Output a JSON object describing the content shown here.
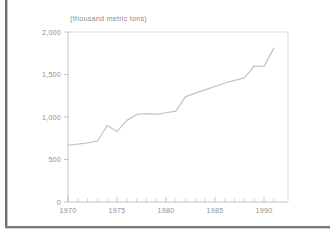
{
  "page": {
    "background_color": "#ffffff",
    "border_color": "#6e6e6e"
  },
  "chart_data": {
    "type": "line",
    "title": "(thousand metric tons)",
    "subtitle": "",
    "xlabel": "",
    "ylabel": "",
    "xlim": [
      1969,
      1991.5
    ],
    "ylim": [
      0,
      2000
    ],
    "grid": false,
    "legend_position": "none",
    "line_color": "#c4c4c4",
    "axis_color": "#b6b6b6",
    "tick_label_color": "#8f8f8f",
    "y_ticks": [
      0,
      500,
      1000,
      1500,
      2000
    ],
    "y_tick_labels": [
      "0",
      "500",
      "1,000",
      "1,500",
      "2,000"
    ],
    "x_ticks": [
      1970,
      1975,
      1980,
      1985,
      1990
    ],
    "x_tick_labels": [
      "1970",
      "1975",
      "1980",
      "1985",
      "1990"
    ],
    "x_minor_ticks": [
      1971,
      1972,
      1973,
      1974,
      1976,
      1977,
      1978,
      1979,
      1981,
      1982,
      1983,
      1984,
      1986,
      1987,
      1988,
      1989,
      1991
    ],
    "series": [
      {
        "name": "production",
        "x": [
          1970,
          1971,
          1972,
          1973,
          1974,
          1975,
          1976,
          1977,
          1978,
          1979,
          1980,
          1981,
          1982,
          1983,
          1984,
          1985,
          1986,
          1987,
          1988,
          1989,
          1990,
          1991
        ],
        "values": [
          670,
          680,
          695,
          715,
          900,
          830,
          960,
          1030,
          1040,
          1030,
          1050,
          1070,
          1240,
          1280,
          1320,
          1360,
          1400,
          1430,
          1460,
          1600,
          1595,
          1810
        ]
      }
    ]
  }
}
